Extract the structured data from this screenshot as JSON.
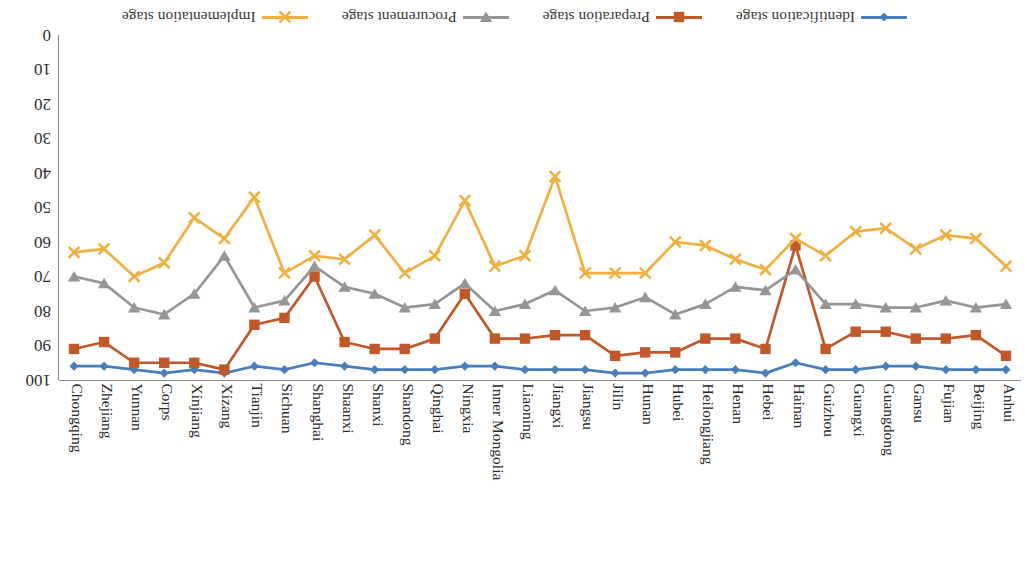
{
  "chart_data": {
    "type": "line",
    "title": "",
    "xlabel": "",
    "ylabel": "",
    "ylim": [
      0,
      100
    ],
    "yticks": [
      0,
      10,
      20,
      30,
      40,
      50,
      60,
      70,
      80,
      90,
      100
    ],
    "grid": false,
    "orientation_note": "rendered rotated 180 degrees",
    "legend_position": "bottom",
    "categories": [
      "Anhui",
      "Beijing",
      "Fujian",
      "Gansu",
      "Guangdong",
      "Guangxi",
      "Guizhou",
      "Hainan",
      "Hebei",
      "Henan",
      "Heilongjiang",
      "Hubei",
      "Hunan",
      "Jilin",
      "Jiangsu",
      "Jiangxi",
      "Liaoning",
      "Inner Mongolia",
      "Ningxia",
      "Qinghai",
      "Shandong",
      "Shanxi",
      "Shaanxi",
      "Shanghai",
      "Sichuan",
      "Tianjin",
      "Xizang",
      "Xinjiang",
      "Corps",
      "Yunnan",
      "Zhejiang",
      "Chongqing"
    ],
    "series": [
      {
        "name": "Identification stage",
        "color": "#4A7EBB",
        "marker": "diamond",
        "values": [
          97,
          97,
          97,
          96,
          96,
          97,
          97,
          95,
          98,
          97,
          97,
          97,
          98,
          98,
          97,
          97,
          97,
          96,
          96,
          97,
          97,
          97,
          96,
          95,
          97,
          96,
          98,
          97,
          98,
          97,
          96,
          96
        ]
      },
      {
        "name": "Preparation stage",
        "color": "#C0582A",
        "marker": "square",
        "values": [
          93,
          87,
          88,
          88,
          86,
          86,
          91,
          61,
          91,
          88,
          88,
          92,
          92,
          93,
          87,
          87,
          88,
          88,
          75,
          88,
          91,
          91,
          89,
          70,
          82,
          84,
          97,
          95,
          95,
          95,
          89,
          91
        ]
      },
      {
        "name": "Procurement stage",
        "color": "#969696",
        "marker": "triangle",
        "values": [
          78,
          79,
          77,
          79,
          79,
          78,
          78,
          68,
          74,
          73,
          78,
          81,
          76,
          79,
          80,
          74,
          78,
          80,
          72,
          78,
          79,
          75,
          73,
          67,
          77,
          79,
          64,
          75,
          81,
          79,
          72,
          70
        ]
      },
      {
        "name": "Implementation stage",
        "color": "#F0B041",
        "marker": "cross",
        "values": [
          67,
          59,
          58,
          62,
          56,
          57,
          64,
          59,
          68,
          65,
          61,
          60,
          69,
          69,
          69,
          41,
          64,
          67,
          48,
          64,
          69,
          58,
          65,
          64,
          69,
          47,
          59,
          53,
          66,
          70,
          62,
          63
        ]
      }
    ]
  },
  "legend": {
    "items": [
      {
        "label": "Identification stage"
      },
      {
        "label": "Preparation stage"
      },
      {
        "label": "Procurement stage"
      },
      {
        "label": "Implementation stage"
      }
    ]
  },
  "axes": {
    "y_tick_labels": [
      "0",
      "10",
      "20",
      "30",
      "40",
      "50",
      "60",
      "70",
      "80",
      "90",
      "100"
    ]
  }
}
